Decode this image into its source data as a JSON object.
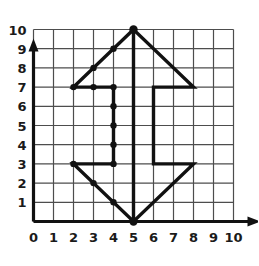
{
  "figure": {
    "title": "",
    "type": "coordinate-grid-polygon",
    "background_color": "#ffffff",
    "grid_color": "#4d4d4d",
    "axis_color": "#111111",
    "shape_color": "#111111",
    "point_color": "#111111"
  },
  "axes": {
    "x": {
      "label": "",
      "min": 0,
      "max": 10,
      "tick_labels": [
        "0",
        "1",
        "2",
        "3",
        "4",
        "5",
        "6",
        "7",
        "8",
        "9",
        "10"
      ],
      "arrow": true
    },
    "y": {
      "label": "",
      "min": 0,
      "max": 10,
      "tick_labels": [
        "1",
        "2",
        "3",
        "4",
        "5",
        "6",
        "7",
        "8",
        "9",
        "10"
      ],
      "arrow": true
    }
  },
  "chart_data": {
    "type": "line",
    "title": "",
    "xlabel": "",
    "ylabel": "",
    "xlim": [
      0,
      10
    ],
    "ylim": [
      0,
      10
    ],
    "grid": true,
    "legend": "none",
    "series": [
      {
        "name": "arrow-outline",
        "closed": true,
        "points": [
          [
            5,
            10
          ],
          [
            2,
            7
          ],
          [
            4,
            7
          ],
          [
            4,
            3
          ],
          [
            2,
            3
          ],
          [
            5,
            0
          ],
          [
            8,
            3
          ],
          [
            6,
            3
          ],
          [
            6,
            7
          ],
          [
            8,
            7
          ]
        ]
      },
      {
        "name": "center-stem",
        "closed": false,
        "points": [
          [
            5,
            0
          ],
          [
            5,
            10
          ]
        ]
      }
    ],
    "marked_points": [
      [
        5,
        10
      ],
      [
        4,
        9
      ],
      [
        3,
        8
      ],
      [
        2,
        7
      ],
      [
        3,
        7
      ],
      [
        4,
        7
      ],
      [
        4,
        6
      ],
      [
        4,
        5
      ],
      [
        4,
        4
      ],
      [
        4,
        3
      ],
      [
        2,
        3
      ],
      [
        3,
        2
      ],
      [
        4,
        1
      ],
      [
        5,
        0
      ]
    ]
  }
}
